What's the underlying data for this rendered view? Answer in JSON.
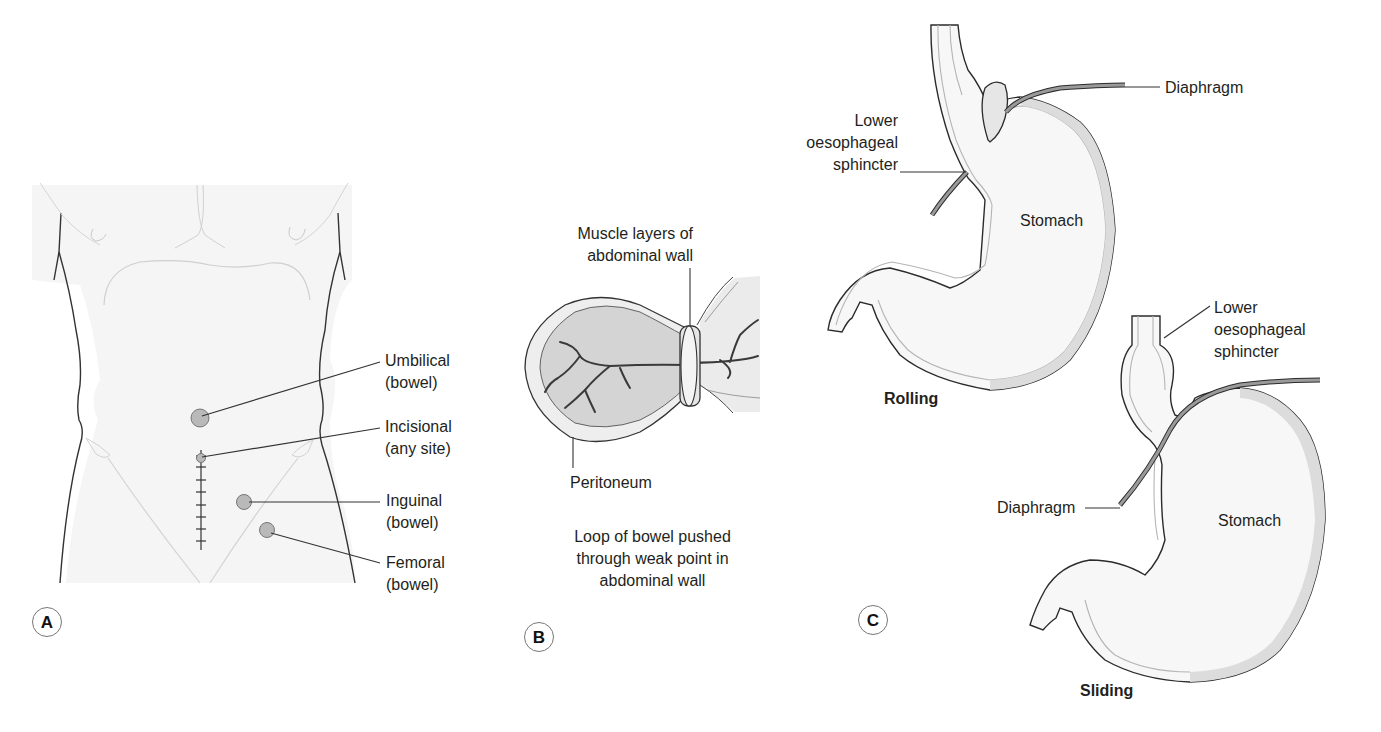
{
  "panels": {
    "a": {
      "badge": "A",
      "labels": {
        "umbilical_1": "Umbilical",
        "umbilical_2": "(bowel)",
        "incisional_1": "Incisional",
        "incisional_2": "(any site)",
        "inguinal_1": "Inguinal",
        "inguinal_2": "(bowel)",
        "femoral_1": "Femoral",
        "femoral_2": "(bowel)"
      }
    },
    "b": {
      "badge": "B",
      "labels": {
        "muscle_1": "Muscle layers of",
        "muscle_2": "abdominal wall",
        "peritoneum": "Peritoneum",
        "caption_1": "Loop of bowel pushed",
        "caption_2": "through weak point in",
        "caption_3": "abdominal wall"
      }
    },
    "c": {
      "badge": "C",
      "rolling": {
        "title": "Rolling",
        "diaphragm": "Diaphragm",
        "les_1": "Lower",
        "les_2": "oesophageal",
        "les_3": "sphincter",
        "stomach": "Stomach"
      },
      "sliding": {
        "title": "Sliding",
        "diaphragm": "Diaphragm",
        "les_1": "Lower",
        "les_2": "oesophageal",
        "les_3": "sphincter",
        "stomach": "Stomach"
      }
    }
  },
  "colors": {
    "outline": "#2b2b2b",
    "wall_fill": "#dcdcdc",
    "lumen_fill": "#f7f7f7",
    "diaphragm": "#8f8f8f",
    "hernia_dot": "#b9b9b9",
    "skin_line": "#cfcfcf"
  }
}
